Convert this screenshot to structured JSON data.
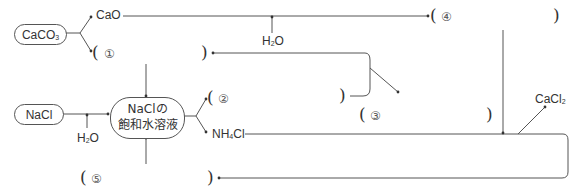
{
  "diagram": {
    "type": "ammonia-soda process flow (Solvay process)",
    "nodes": {
      "caco3": {
        "label": "CaCO",
        "sub": "3"
      },
      "nacl": {
        "label": "NaCl"
      },
      "saturated_solution": {
        "line1": "NaClの",
        "line2": "飽和水溶液"
      }
    },
    "products": {
      "cao": {
        "label": "CaO"
      },
      "h2o_top": {
        "label": "H",
        "sub": "2",
        "tail": "O"
      },
      "h2o_left": {
        "label": "H",
        "sub": "2",
        "tail": "O"
      },
      "nh4cl": {
        "label": "NH",
        "sub": "4",
        "tail": "Cl"
      },
      "cacl2": {
        "label": "CaCl",
        "sub": "2"
      }
    },
    "blanks": [
      {
        "id": "1",
        "marker": "①",
        "open": "(",
        "close": ")"
      },
      {
        "id": "2",
        "marker": "②",
        "open": "(",
        "close": ")"
      },
      {
        "id": "3",
        "marker": "③",
        "open": "(",
        "close": ")"
      },
      {
        "id": "4",
        "marker": "④",
        "open": "(",
        "close": ")"
      },
      {
        "id": "5",
        "marker": "⑤",
        "open": "(",
        "close": ")"
      }
    ]
  }
}
